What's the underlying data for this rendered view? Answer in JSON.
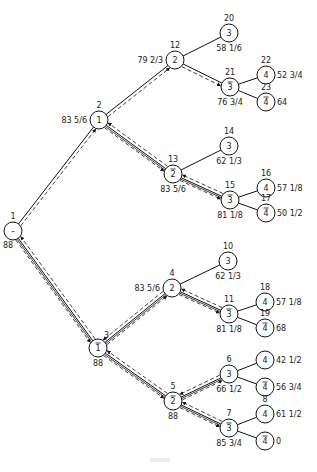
{
  "diagram": {
    "type": "branch-and-bound search tree",
    "nodes": [
      {
        "id": "n1",
        "x": 13,
        "y": 231,
        "number": "1",
        "var": "–",
        "bar": false,
        "value": "88",
        "num_pos": "above",
        "val_pos": "below-left"
      },
      {
        "id": "n2",
        "x": 99,
        "y": 120,
        "number": "2",
        "var": "1",
        "bar": false,
        "value": "83 5/6",
        "num_pos": "above",
        "val_pos": "left"
      },
      {
        "id": "n12",
        "x": 175,
        "y": 60,
        "number": "12",
        "var": "2",
        "bar": false,
        "value": "79 2/3",
        "num_pos": "above",
        "val_pos": "left"
      },
      {
        "id": "n20",
        "x": 229,
        "y": 33,
        "number": "20",
        "var": "3",
        "bar": false,
        "value": "58 1/6",
        "num_pos": "above",
        "val_pos": "below"
      },
      {
        "id": "n21",
        "x": 230,
        "y": 87,
        "number": "21",
        "var": "3",
        "bar": true,
        "value": "76 3/4",
        "num_pos": "above",
        "val_pos": "below"
      },
      {
        "id": "n22",
        "x": 266,
        "y": 75,
        "number": "22",
        "var": "4",
        "bar": false,
        "value": "52 3/4",
        "num_pos": "above",
        "val_pos": "right"
      },
      {
        "id": "n23",
        "x": 266,
        "y": 102,
        "number": "23",
        "var": "4",
        "bar": true,
        "value": "64",
        "num_pos": "above",
        "val_pos": "right"
      },
      {
        "id": "n13",
        "x": 173,
        "y": 174,
        "number": "13",
        "var": "2",
        "bar": true,
        "value": "83 5/6",
        "num_pos": "above",
        "val_pos": "below"
      },
      {
        "id": "n14",
        "x": 229,
        "y": 146,
        "number": "14",
        "var": "3",
        "bar": false,
        "value": "62 1/3",
        "num_pos": "above",
        "val_pos": "below"
      },
      {
        "id": "n15",
        "x": 230,
        "y": 200,
        "number": "15",
        "var": "3",
        "bar": true,
        "value": "81 1/8",
        "num_pos": "above",
        "val_pos": "below"
      },
      {
        "id": "n16",
        "x": 266,
        "y": 188,
        "number": "16",
        "var": "4",
        "bar": false,
        "value": "57 1/8",
        "num_pos": "above",
        "val_pos": "right"
      },
      {
        "id": "n17",
        "x": 266,
        "y": 213,
        "number": "17",
        "var": "4",
        "bar": true,
        "value": "50 1/2",
        "num_pos": "above",
        "val_pos": "right"
      },
      {
        "id": "n3",
        "x": 98,
        "y": 348,
        "number": "3",
        "var": "1",
        "bar": true,
        "value": "88",
        "num_pos": "above-right",
        "val_pos": "below"
      },
      {
        "id": "n4",
        "x": 172,
        "y": 288,
        "number": "4",
        "var": "2",
        "bar": false,
        "value": "83 5/6",
        "num_pos": "above",
        "val_pos": "left"
      },
      {
        "id": "n10",
        "x": 228,
        "y": 261,
        "number": "10",
        "var": "3",
        "bar": false,
        "value": "62 1/3",
        "num_pos": "above",
        "val_pos": "below"
      },
      {
        "id": "n11",
        "x": 229,
        "y": 314,
        "number": "11",
        "var": "3",
        "bar": true,
        "value": "81 1/8",
        "num_pos": "above",
        "val_pos": "below"
      },
      {
        "id": "n18",
        "x": 265,
        "y": 302,
        "number": "18",
        "var": "4",
        "bar": false,
        "value": "57 1/8",
        "num_pos": "above",
        "val_pos": "right"
      },
      {
        "id": "n19",
        "x": 265,
        "y": 328,
        "number": "19",
        "var": "4",
        "bar": true,
        "value": "68",
        "num_pos": "above",
        "val_pos": "right"
      },
      {
        "id": "n5",
        "x": 173,
        "y": 401,
        "number": "5",
        "var": "2",
        "bar": true,
        "value": "88",
        "num_pos": "above",
        "val_pos": "below"
      },
      {
        "id": "n6",
        "x": 229,
        "y": 374,
        "number": "6",
        "var": "3",
        "bar": false,
        "value": "66 1/2",
        "num_pos": "above",
        "val_pos": "below"
      },
      {
        "id": "n7",
        "x": 229,
        "y": 428,
        "number": "7",
        "var": "3",
        "bar": true,
        "value": "85 3/4",
        "num_pos": "above",
        "val_pos": "below"
      },
      {
        "id": "n6a",
        "x": 265,
        "y": 360,
        "number": "",
        "var": "4",
        "bar": false,
        "value": "42 1/2",
        "num_pos": "above",
        "val_pos": "right"
      },
      {
        "id": "n6b",
        "x": 265,
        "y": 387,
        "number": "",
        "var": "4",
        "bar": true,
        "value": "56 3/4",
        "num_pos": "above",
        "val_pos": "right"
      },
      {
        "id": "n8",
        "x": 265,
        "y": 414,
        "number": "8",
        "var": "4",
        "bar": false,
        "value": "61 1/2",
        "num_pos": "above",
        "val_pos": "right"
      },
      {
        "id": "n9",
        "x": 265,
        "y": 441,
        "number": "",
        "var": "4",
        "bar": true,
        "value": "0",
        "num_pos": "above",
        "val_pos": "right"
      }
    ],
    "edges": [
      {
        "from": "n1",
        "to": "n2",
        "traversed": "forward"
      },
      {
        "from": "n1",
        "to": "n3",
        "traversed": "both"
      },
      {
        "from": "n2",
        "to": "n12",
        "traversed": "forward"
      },
      {
        "from": "n2",
        "to": "n13",
        "traversed": "both"
      },
      {
        "from": "n12",
        "to": "n20",
        "traversed": "none"
      },
      {
        "from": "n12",
        "to": "n21",
        "traversed": "forward"
      },
      {
        "from": "n21",
        "to": "n22",
        "traversed": "none"
      },
      {
        "from": "n21",
        "to": "n23",
        "traversed": "none"
      },
      {
        "from": "n13",
        "to": "n14",
        "traversed": "none"
      },
      {
        "from": "n13",
        "to": "n15",
        "traversed": "both"
      },
      {
        "from": "n15",
        "to": "n16",
        "traversed": "none"
      },
      {
        "from": "n15",
        "to": "n17",
        "traversed": "none"
      },
      {
        "from": "n3",
        "to": "n4",
        "traversed": "both"
      },
      {
        "from": "n3",
        "to": "n5",
        "traversed": "both"
      },
      {
        "from": "n4",
        "to": "n10",
        "traversed": "none"
      },
      {
        "from": "n4",
        "to": "n11",
        "traversed": "both"
      },
      {
        "from": "n11",
        "to": "n18",
        "traversed": "none"
      },
      {
        "from": "n11",
        "to": "n19",
        "traversed": "none"
      },
      {
        "from": "n5",
        "to": "n6",
        "traversed": "both"
      },
      {
        "from": "n5",
        "to": "n7",
        "traversed": "both"
      },
      {
        "from": "n6",
        "to": "n6a",
        "traversed": "none"
      },
      {
        "from": "n6",
        "to": "n6b",
        "traversed": "none"
      },
      {
        "from": "n7",
        "to": "n8",
        "traversed": "none"
      },
      {
        "from": "n7",
        "to": "n9",
        "traversed": "none"
      }
    ]
  }
}
